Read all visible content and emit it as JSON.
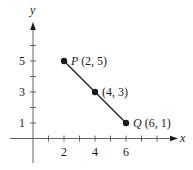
{
  "chart_data": {
    "type": "line",
    "title": "",
    "xlabel": "x",
    "ylabel": "y",
    "xlim": [
      -2,
      9.8
    ],
    "ylim": [
      -2,
      7.4
    ],
    "grid": false,
    "x_ticks": [
      1,
      2,
      3,
      4,
      5,
      6,
      7,
      8
    ],
    "x_tick_labels": [
      {
        "value": 2,
        "label": "2"
      },
      {
        "value": 4,
        "label": "4"
      },
      {
        "value": 6,
        "label": "6"
      }
    ],
    "y_ticks": [
      1,
      2,
      3,
      4,
      5,
      6
    ],
    "y_tick_labels": [
      {
        "value": 1,
        "label": "1"
      },
      {
        "value": 3,
        "label": "3"
      },
      {
        "value": 5,
        "label": "5"
      }
    ],
    "series": [
      {
        "name": "segment PQ",
        "points": [
          {
            "x": 2,
            "y": 5,
            "name": "P",
            "label": "(2, 5)"
          },
          {
            "x": 4,
            "y": 3,
            "name": "",
            "label": "(4, 3)"
          },
          {
            "x": 6,
            "y": 1,
            "name": "Q",
            "label": "(6, 1)"
          }
        ]
      }
    ],
    "colors": {
      "ink": "#1a1a1a",
      "axis": "#555555"
    }
  }
}
